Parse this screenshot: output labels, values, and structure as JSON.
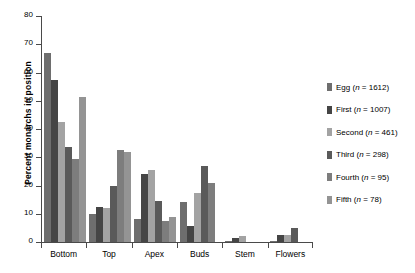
{
  "chart_data": {
    "type": "bar",
    "title": "",
    "subtitle": "",
    "xlabel": "",
    "ylabel": "Percent monarchs in position",
    "categories": [
      "Bottom",
      "Top",
      "Apex",
      "Buds",
      "Stem",
      "Flowers"
    ],
    "ylim": [
      0,
      80
    ],
    "yticks": [
      0,
      10,
      20,
      30,
      40,
      50,
      60,
      70,
      80
    ],
    "ytick_labels": [
      "0",
      "10",
      "20",
      "30",
      "40",
      "50",
      "60",
      "70",
      "80"
    ],
    "grid": false,
    "legend_position": "right",
    "series": [
      {
        "name": "Egg",
        "n": 1612,
        "legend_label": "Egg (n = 1612)",
        "color": "#6e6e6e",
        "values": [
          67.0,
          10.0,
          8.2,
          14.2,
          0.5,
          0.5
        ]
      },
      {
        "name": "First",
        "n": 1007,
        "legend_label": "First (n = 1007)",
        "color": "#454545",
        "values": [
          57.5,
          12.5,
          24.0,
          5.5,
          1.5,
          2.5
        ]
      },
      {
        "name": "Second",
        "n": 461,
        "legend_label": "Second (n = 461)",
        "color": "#a3a3a3",
        "values": [
          42.5,
          12.0,
          25.5,
          17.2,
          2.0,
          2.5
        ]
      },
      {
        "name": "Third",
        "n": 298,
        "legend_label": "Third (n = 298)",
        "color": "#5a5a5a",
        "values": [
          33.5,
          20.0,
          14.5,
          27.0,
          0.0,
          5.0
        ]
      },
      {
        "name": "Fourth",
        "n": 95,
        "legend_label": "Fourth (n = 95)",
        "color": "#7d7d7d",
        "values": [
          29.5,
          32.5,
          7.5,
          21.0,
          0.0,
          0.0
        ]
      },
      {
        "name": "Fifth",
        "n": 78,
        "legend_label": "Fifth (n = 78)",
        "color": "#949494",
        "values": [
          51.5,
          32.0,
          9.0,
          0.0,
          0.0,
          0.0
        ]
      }
    ]
  }
}
